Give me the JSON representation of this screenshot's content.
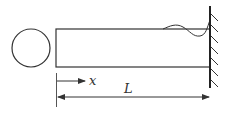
{
  "diagram": {
    "labels": {
      "x_axis": "x",
      "length": "L"
    },
    "colors": {
      "stroke": "#333333",
      "background": "#ffffff"
    },
    "elements": {
      "cross_section": "circle",
      "beam": "rectangle",
      "support": "fixed-wall",
      "deflection_curve": "wavy line near wall"
    }
  }
}
